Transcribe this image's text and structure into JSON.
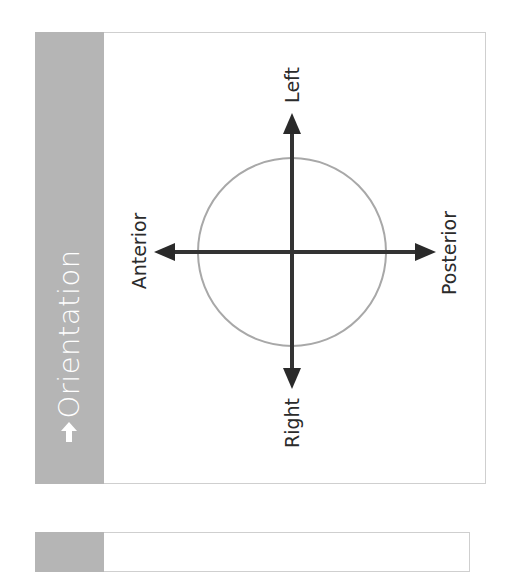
{
  "panel": {
    "title": "Orientation",
    "icon": "arrow-up-icon",
    "sidebar_color": "#b5b5b5"
  },
  "diagram": {
    "labels": {
      "top": "Left",
      "bottom": "Right",
      "left": "Anterior",
      "right": "Posterior"
    },
    "circle_color": "#a8a8a8",
    "axis_color": "#333333"
  }
}
